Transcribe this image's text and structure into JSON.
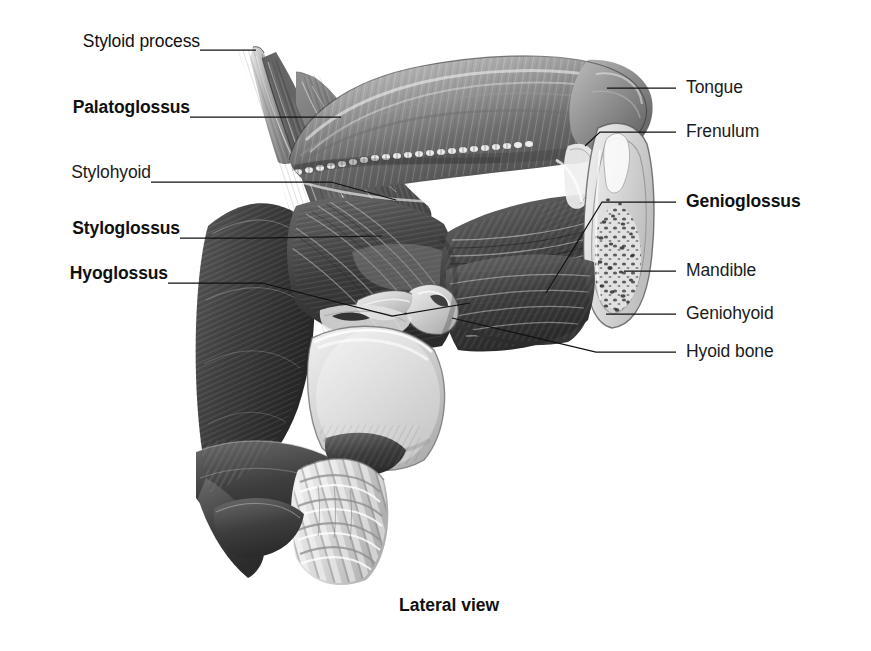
{
  "figure": {
    "caption": "Lateral view",
    "background_color": "#ffffff",
    "ink_color": "#1b1b1b",
    "style": "grayscale anatomical illustration"
  },
  "labels_left": [
    {
      "id": "styloid-process",
      "text": "Styloid process",
      "bold": false,
      "x": 46,
      "y": 42,
      "leader_from": [
        200,
        50
      ],
      "leader_to": [
        253,
        50
      ]
    },
    {
      "id": "palatoglossus",
      "text": "Palatoglossus",
      "bold": true,
      "x": 46,
      "y": 108,
      "leader_from": [
        190,
        117
      ],
      "leader_to": [
        341,
        117
      ]
    },
    {
      "id": "stylohyoid",
      "text": "Stylohyoid",
      "bold": false,
      "x": 46,
      "y": 173,
      "leader_from": [
        151,
        182
      ],
      "leader_to": [
        395,
        200
      ]
    },
    {
      "id": "styloglossus",
      "text": "Styloglossus",
      "bold": true,
      "x": 46,
      "y": 229,
      "leader_from": [
        180,
        238
      ],
      "leader_to": [
        381,
        237
      ]
    },
    {
      "id": "hyoglossus",
      "text": "Hyoglossus",
      "bold": true,
      "x": 46,
      "y": 274,
      "leader_from": [
        168,
        283
      ],
      "leader_to": [
        360,
        285
      ]
    }
  ],
  "labels_right": [
    {
      "id": "tongue",
      "text": "Tongue",
      "bold": false,
      "x": 686,
      "y": 79,
      "leader_from": [
        676,
        88
      ],
      "leader_to": [
        608,
        88
      ]
    },
    {
      "id": "frenulum",
      "text": "Frenulum",
      "bold": false,
      "x": 686,
      "y": 123,
      "leader_from": [
        676,
        132
      ],
      "leader_to": [
        598,
        132
      ]
    },
    {
      "id": "genioglossus",
      "text": "Genioglossus",
      "bold": true,
      "x": 686,
      "y": 193,
      "leader_from": [
        676,
        202
      ],
      "leader_to": [
        601,
        202
      ]
    },
    {
      "id": "mandible",
      "text": "Mandible",
      "bold": false,
      "x": 686,
      "y": 262,
      "leader_from": [
        676,
        271
      ],
      "leader_to": [
        625,
        271
      ]
    },
    {
      "id": "geniohyoid",
      "text": "Geniohyoid",
      "bold": false,
      "x": 686,
      "y": 305,
      "leader_from": [
        676,
        314
      ],
      "leader_to": [
        606,
        314
      ]
    },
    {
      "id": "hyoid-bone",
      "text": "Hyoid bone",
      "bold": false,
      "x": 686,
      "y": 343,
      "leader_from": [
        676,
        352
      ],
      "leader_to": [
        451,
        318
      ]
    }
  ],
  "caption_position": {
    "x": 399,
    "y": 595
  },
  "internal_leaders": [
    {
      "id": "stylohyoid-elbow",
      "points": [
        [
          151,
          182
        ],
        [
          393,
          200
        ]
      ]
    },
    {
      "id": "styloglossus-elbow",
      "points": [
        [
          180,
          238
        ],
        [
          255,
          238
        ],
        [
          382,
          237
        ]
      ]
    },
    {
      "id": "hyoglossus-elbow",
      "points": [
        [
          168,
          283
        ],
        [
          262,
          283
        ],
        [
          392,
          316
        ],
        [
          468,
          304
        ]
      ]
    },
    {
      "id": "genioglossus-inner",
      "points": [
        [
          601,
          202
        ],
        [
          547,
          292
        ]
      ]
    },
    {
      "id": "frenulum-inner",
      "points": [
        [
          598,
          132
        ],
        [
          583,
          147
        ]
      ]
    }
  ],
  "structures": [
    {
      "id": "styloid-process",
      "name": "Styloid process"
    },
    {
      "id": "styloglossus-muscle",
      "name": "Styloglossus muscle"
    },
    {
      "id": "stylohyoid-muscle",
      "name": "Stylohyoid muscle"
    },
    {
      "id": "palatoglossus-muscle",
      "name": "Palatoglossus muscle"
    },
    {
      "id": "tongue-body",
      "name": "Tongue"
    },
    {
      "id": "lingual-frenulum",
      "name": "Frenulum"
    },
    {
      "id": "genioglossus-muscle",
      "name": "Genioglossus muscle"
    },
    {
      "id": "hyoglossus-muscle",
      "name": "Hyoglossus muscle"
    },
    {
      "id": "geniohyoid-muscle",
      "name": "Geniohyoid muscle"
    },
    {
      "id": "mandible-section",
      "name": "Mandible (sectioned)"
    },
    {
      "id": "hyoid-bone",
      "name": "Hyoid bone"
    },
    {
      "id": "thyroid-cartilage",
      "name": "Thyroid cartilage"
    },
    {
      "id": "trachea-rings",
      "name": "Tracheal rings"
    },
    {
      "id": "pharyngeal-constrictor",
      "name": "Pharyngeal constrictor muscle"
    }
  ]
}
